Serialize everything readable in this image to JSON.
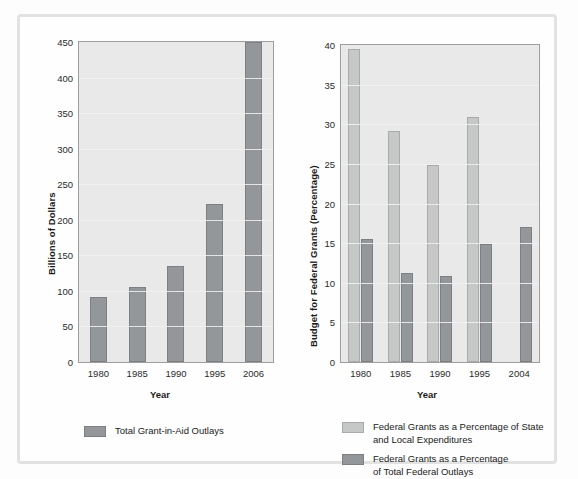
{
  "chart_data": [
    {
      "id": "total-grant-in-aid-outlays",
      "type": "bar",
      "title": "",
      "xlabel": "Year",
      "ylabel": "Billions of Dollars",
      "categories": [
        "1980",
        "1985",
        "1990",
        "1995",
        "2006"
      ],
      "yticks": [
        0,
        50,
        100,
        150,
        200,
        250,
        300,
        350,
        400,
        450
      ],
      "ylim": [
        0,
        450
      ],
      "grid": true,
      "legend_position": "bottom",
      "series": [
        {
          "name": "Total Grant-in-Aid Outlays",
          "color": "#949799",
          "values": [
            91,
            105,
            135,
            222,
            450
          ]
        }
      ]
    },
    {
      "id": "federal-grants-percentages",
      "type": "bar",
      "title": "",
      "xlabel": "Year",
      "ylabel": "Budget for Federal Grants (Percentage)",
      "categories": [
        "1980",
        "1985",
        "1990",
        "1995",
        "2004"
      ],
      "yticks": [
        0,
        5,
        10,
        15,
        20,
        25,
        30,
        35,
        40
      ],
      "ylim": [
        0,
        40
      ],
      "grid": true,
      "legend_position": "bottom",
      "series": [
        {
          "name": "Federal Grants as a Percentage of State\nand Local Expenditures",
          "color": "#c6c7c7",
          "values": [
            39.5,
            29.1,
            24.8,
            30.9,
            null
          ]
        },
        {
          "name": "Federal Grants as a Percentage\nof Total Federal Outlays",
          "color": "#949799",
          "values": [
            15.5,
            11.2,
            10.9,
            14.9,
            17.0
          ]
        }
      ]
    }
  ],
  "left_chart": {
    "ylabel": "Billions of Dollars",
    "xlabel": "Year",
    "yticks": [
      "450",
      "400",
      "350",
      "300",
      "250",
      "200",
      "150",
      "100",
      "50",
      "0"
    ],
    "xlabels": [
      "1980",
      "1985",
      "1990",
      "1995",
      "2006"
    ],
    "legend": [
      {
        "label": "Total Grant-in-Aid Outlays",
        "swatch": "dark"
      }
    ]
  },
  "right_chart": {
    "ylabel": "Budget for Federal Grants (Percentage)",
    "xlabel": "Year",
    "yticks": [
      "40",
      "35",
      "30",
      "25",
      "20",
      "15",
      "10",
      "5",
      "0"
    ],
    "xlabels": [
      "1980",
      "1985",
      "1990",
      "1995",
      "2004"
    ],
    "legend": [
      {
        "label": "Federal Grants as a Percentage of State\nand Local Expenditures",
        "swatch": "light"
      },
      {
        "label": "Federal Grants as a Percentage\nof Total Federal Outlays",
        "swatch": "dark"
      }
    ]
  },
  "colors": {
    "light_bar": "#c6c7c7",
    "dark_bar": "#949799",
    "plot_background": "#e9e9e9",
    "frame": "#e2e2e2"
  }
}
